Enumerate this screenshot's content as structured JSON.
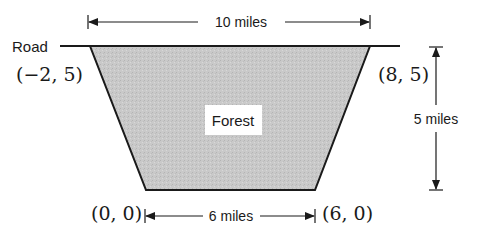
{
  "diagram": {
    "road_label": "Road",
    "region_label": "Forest",
    "top_width_label": "10 miles",
    "bottom_width_label": "6 miles",
    "height_label": "5 miles",
    "vertices": {
      "top_left": "(−2, 5)",
      "top_right": "(8, 5)",
      "bottom_left": "(0, 0)",
      "bottom_right": "(6, 0)"
    },
    "colors": {
      "fill": "#c8c8c8",
      "stroke": "#1a1a1a",
      "label_bg": "#ffffff"
    }
  }
}
